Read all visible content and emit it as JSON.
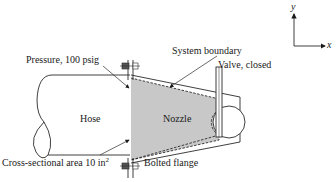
{
  "diagram": {
    "labels": {
      "pressure": "Pressure, 100 psig",
      "system_boundary": "System boundary",
      "valve": "Valve, closed",
      "hose": "Hose",
      "nozzle": "Nozzle",
      "area_text": "Cross-sectional area 10 in",
      "area_exp": "2",
      "flange": "Bolted flange"
    },
    "axes": {
      "x": "x",
      "y": "y"
    },
    "colors": {
      "nozzle_fill": "#c8c8c8",
      "line": "#2a2a2a",
      "background": "#ffffff"
    }
  }
}
